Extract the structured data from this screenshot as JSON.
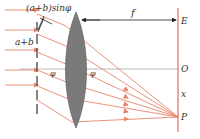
{
  "diagram": {
    "type": "physics-optics",
    "labels": {
      "path_difference": "(a+b)sinφ",
      "grating_constant": "a+b",
      "focal_length": "f",
      "screen_top": "E",
      "center": "O",
      "displacement": "x",
      "focus_point": "P",
      "angle_left": "φ",
      "angle_right": "φ"
    },
    "colors": {
      "ray": "#e8846a",
      "screen": "#e0705a",
      "lens": "#7a7a7a",
      "lens_stroke": "#555555",
      "grating": "#333333",
      "axis": "#aaaaaa",
      "text": "#333333"
    }
  }
}
